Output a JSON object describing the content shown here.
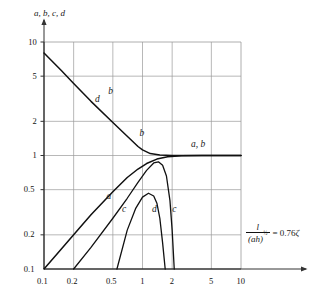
{
  "chart_data": {
    "type": "line",
    "title": "",
    "xlabel": "",
    "ylabel": "a, b, c, d",
    "xscale": "log",
    "yscale": "log",
    "xlim": [
      0.1,
      10
    ],
    "ylim": [
      0.1,
      10
    ],
    "grid": true,
    "legend": "inline-curve-labels",
    "xticks": [
      "0.1",
      "0.2",
      "0.5",
      "1",
      "2",
      "5",
      "10"
    ],
    "xtick_values": [
      0.1,
      0.2,
      0.5,
      1,
      2,
      5,
      10
    ],
    "yticks": [
      "0.1",
      "0.2",
      "0.5",
      "1",
      "2",
      "5",
      "10"
    ],
    "ytick_values": [
      0.1,
      0.2,
      0.5,
      1,
      2,
      5,
      10
    ],
    "series": [
      {
        "name": "a",
        "label": "a",
        "comment": "rising straight line on log-log from lower left, merges into horizontal asymptote at 1",
        "x": [
          0.1,
          0.15,
          0.2,
          0.3,
          0.5,
          0.7,
          0.9,
          1.1,
          1.4,
          1.8,
          2.5,
          4.0,
          6.0,
          10.0
        ],
        "y": [
          0.1,
          0.15,
          0.2,
          0.3,
          0.48,
          0.64,
          0.76,
          0.85,
          0.93,
          0.975,
          0.995,
          1.0,
          1.0,
          1.0
        ]
      },
      {
        "name": "b",
        "label": "b",
        "comment": "descending straight line from upper left that bends and flattens to 1",
        "x": [
          0.1,
          0.15,
          0.2,
          0.3,
          0.5,
          0.7,
          0.9,
          1.0,
          1.2,
          1.5,
          2.0,
          3.0,
          5.0,
          10.0
        ],
        "y": [
          8.0,
          5.6,
          4.3,
          3.0,
          1.95,
          1.48,
          1.2,
          1.12,
          1.04,
          1.01,
          1.0,
          1.0,
          1.0,
          1.0
        ]
      },
      {
        "name": "c",
        "label": "c",
        "comment": "rises from ~0.2, crosses b, peaks near x=1.4 then plunges to axis near x=2.1",
        "x": [
          0.2,
          0.3,
          0.5,
          0.7,
          0.9,
          1.1,
          1.3,
          1.45,
          1.6,
          1.75,
          1.9,
          2.0,
          2.1
        ],
        "y": [
          0.1,
          0.155,
          0.28,
          0.42,
          0.58,
          0.74,
          0.86,
          0.88,
          0.82,
          0.66,
          0.4,
          0.22,
          0.1
        ]
      },
      {
        "name": "d",
        "label": "d",
        "comment": "small arch peaking about 0.46 near x=1.2, descends steeply to axis near x=1.7",
        "x": [
          0.55,
          0.7,
          0.85,
          1.0,
          1.15,
          1.3,
          1.4,
          1.5,
          1.6,
          1.7
        ],
        "y": [
          0.1,
          0.22,
          0.34,
          0.43,
          0.465,
          0.44,
          0.38,
          0.28,
          0.17,
          0.1
        ]
      }
    ],
    "annotations": [
      {
        "name": "label-b-upper",
        "text": "b",
        "x": 0.45,
        "y": 3.6
      },
      {
        "name": "label-d-upper",
        "text": "d",
        "x": 0.33,
        "y": 3.1
      },
      {
        "name": "label-b-mid",
        "text": "b",
        "x": 0.93,
        "y": 1.55
      },
      {
        "name": "label-ab-right",
        "text": "a, b",
        "x": 3.1,
        "y": 1.25
      },
      {
        "name": "label-a-lower",
        "text": "a",
        "x": 0.43,
        "y": 0.43
      },
      {
        "name": "label-c-lower",
        "text": "c",
        "x": 0.62,
        "y": 0.33
      },
      {
        "name": "label-d-lower",
        "text": "d",
        "x": 1.25,
        "y": 0.33
      },
      {
        "name": "label-c-right",
        "text": "c",
        "x": 2.0,
        "y": 0.33
      }
    ],
    "formula": {
      "numerator": "l",
      "denominator": "(ah)",
      "exponent": "½",
      "equals": "= 0.76",
      "symbol": "ζ",
      "full_text": "l / (ah)^½ = 0.76ζ"
    }
  },
  "axes": {
    "y_axis_title": "a, b, c, d",
    "x_axis_title": ""
  },
  "colors": {
    "curve": "#111111",
    "grid": "#9a9a9a",
    "frame": "#6f6f6f",
    "text": "#1a1a1a",
    "background": "#ffffff"
  }
}
